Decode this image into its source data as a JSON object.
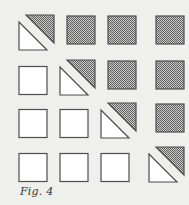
{
  "figure": {
    "caption": "Fig. 4",
    "grid": {
      "rows": 4,
      "cols": 4,
      "cell_size": 28,
      "col_x": [
        19,
        60,
        101,
        149
      ],
      "row_y": [
        22,
        67,
        110,
        154
      ],
      "diagonal_shift": 7
    },
    "colors": {
      "background": "#efefec",
      "outline": "#4d4d4d",
      "white_fill": "#ffffff",
      "stipple_dark": "#5f5f5f",
      "stipple_light": "#cdcdcd"
    },
    "cells": [
      [
        "split",
        "shaded",
        "shaded",
        "shaded"
      ],
      [
        "white",
        "split",
        "shaded",
        "shaded"
      ],
      [
        "white",
        "white",
        "split",
        "shaded"
      ],
      [
        "white",
        "white",
        "white",
        "split"
      ]
    ],
    "legend": {
      "white": "Blank square (below diagonal)",
      "shaded": "Stippled square (above diagonal)",
      "split": "Square split along diagonal: white lower-left triangle, stippled upper-right triangle offset up-right"
    }
  }
}
